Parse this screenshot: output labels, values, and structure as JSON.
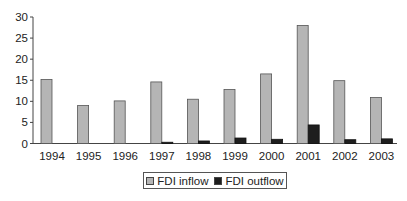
{
  "chart_data": {
    "type": "bar",
    "title": "",
    "xlabel": "",
    "ylabel": "",
    "ylim": [
      0,
      30
    ],
    "yticks": [
      0,
      5,
      10,
      15,
      20,
      25,
      30
    ],
    "grid": false,
    "legend_position": "bottom",
    "categories": [
      "1994",
      "1995",
      "1996",
      "1997",
      "1998",
      "1999",
      "2000",
      "2001",
      "2002",
      "2003"
    ],
    "series": [
      {
        "name": "FDI inflow",
        "color": "#b5b5b5",
        "values": [
          15.2,
          9.0,
          10.1,
          14.6,
          10.5,
          12.8,
          16.5,
          28.0,
          14.9,
          10.9
        ]
      },
      {
        "name": "FDI outflow",
        "color": "#1e1e1e",
        "values": [
          0,
          0,
          0,
          0.3,
          0.6,
          1.3,
          1.0,
          4.4,
          0.9,
          1.1
        ]
      }
    ]
  },
  "legend": {
    "items": [
      {
        "label": "FDI inflow",
        "color": "#b5b5b5"
      },
      {
        "label": "FDI outflow",
        "color": "#1e1e1e"
      }
    ]
  }
}
